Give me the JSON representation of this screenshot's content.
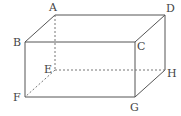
{
  "diagram": {
    "type": "cuboid-wireframe",
    "colors": {
      "edge_visible": "#555555",
      "edge_hidden": "#777777",
      "label": "#444444",
      "background": "#ffffff"
    },
    "vertices": {
      "A": {
        "x": 55,
        "y": 15
      },
      "B": {
        "x": 25,
        "y": 42
      },
      "C": {
        "x": 135,
        "y": 42
      },
      "D": {
        "x": 165,
        "y": 15
      },
      "E": {
        "x": 55,
        "y": 70
      },
      "F": {
        "x": 25,
        "y": 97
      },
      "G": {
        "x": 135,
        "y": 97
      },
      "H": {
        "x": 165,
        "y": 70
      }
    },
    "edges": [
      {
        "from": "A",
        "to": "B",
        "hidden": false
      },
      {
        "from": "A",
        "to": "D",
        "hidden": false
      },
      {
        "from": "B",
        "to": "C",
        "hidden": false
      },
      {
        "from": "C",
        "to": "D",
        "hidden": false
      },
      {
        "from": "B",
        "to": "F",
        "hidden": false
      },
      {
        "from": "C",
        "to": "G",
        "hidden": false
      },
      {
        "from": "D",
        "to": "H",
        "hidden": false
      },
      {
        "from": "F",
        "to": "G",
        "hidden": false
      },
      {
        "from": "G",
        "to": "H",
        "hidden": false
      },
      {
        "from": "A",
        "to": "E",
        "hidden": true
      },
      {
        "from": "E",
        "to": "F",
        "hidden": true
      },
      {
        "from": "E",
        "to": "H",
        "hidden": true
      }
    ],
    "labels": [
      {
        "text": "A",
        "x": 49,
        "y": 11
      },
      {
        "text": "B",
        "x": 13,
        "y": 46
      },
      {
        "text": "C",
        "x": 137,
        "y": 50
      },
      {
        "text": "D",
        "x": 166,
        "y": 12
      },
      {
        "text": "E",
        "x": 44,
        "y": 73
      },
      {
        "text": "F",
        "x": 13,
        "y": 101
      },
      {
        "text": "G",
        "x": 130,
        "y": 111
      },
      {
        "text": "H",
        "x": 167,
        "y": 77
      }
    ]
  }
}
